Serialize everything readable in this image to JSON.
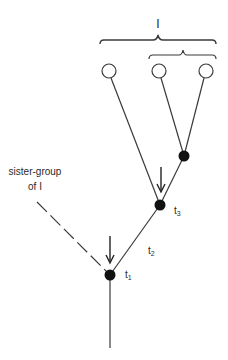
{
  "diagram": {
    "type": "cladogram",
    "group_label": "I",
    "sister_group_label_line1": "sister-group",
    "sister_group_label_line2": "of I",
    "nodes": {
      "t1": {
        "label": "t",
        "sub": "1"
      },
      "t2": {
        "label": "t",
        "sub": "2"
      },
      "t3": {
        "label": "t",
        "sub": "3"
      }
    },
    "terminal_taxa_count": 3,
    "colors": {
      "line": "#3a3a3a",
      "node_fill": "#111111",
      "terminal_fill": "#ffffff",
      "background": "#ffffff"
    }
  }
}
